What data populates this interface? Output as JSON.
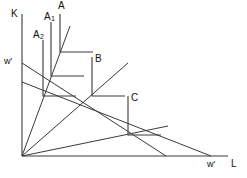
{
  "figure": {
    "type": "economics-isoquant-isocost-diagram",
    "background_color": "#ffffff",
    "line_color": "#3a3a3a",
    "text_color": "#111111"
  },
  "axes": {
    "y_axis_label": "K",
    "x_axis_label": "L",
    "y_axis_price_label": "w′",
    "x_axis_price_label": "w′",
    "origin_px": [
      22,
      156
    ],
    "y_axis_top_px": [
      22,
      14
    ],
    "x_axis_right_px": [
      228,
      156
    ]
  },
  "isoquants": [
    {
      "id": "A",
      "label": "A",
      "label_sub": "",
      "corner_px": [
        60,
        52
      ],
      "vertical_arm_top_px": [
        60,
        14
      ],
      "horizontal_arm_right_px": [
        93,
        52
      ]
    },
    {
      "id": "A1",
      "label": "A",
      "label_sub": "1",
      "corner_px": [
        51,
        76
      ],
      "vertical_arm_top_px": [
        51,
        22
      ],
      "horizontal_arm_right_px": [
        84,
        76
      ]
    },
    {
      "id": "A2",
      "label": "A",
      "label_sub": "2",
      "corner_px": [
        43,
        96
      ],
      "vertical_arm_top_px": [
        43,
        40
      ],
      "horizontal_arm_right_px": [
        76,
        96
      ]
    },
    {
      "id": "B",
      "label": "B",
      "label_sub": "",
      "corner_px": [
        92,
        96
      ],
      "vertical_arm_top_px": [
        92,
        57
      ],
      "horizontal_arm_right_px": [
        125,
        96
      ]
    },
    {
      "id": "C",
      "label": "C",
      "label_sub": "",
      "corner_px": [
        128,
        135
      ],
      "vertical_arm_top_px": [
        128,
        96
      ],
      "horizontal_arm_right_px": [
        161,
        135
      ]
    }
  ],
  "isocost_lines": [
    {
      "id": "isocost-upper",
      "from_px": [
        22,
        63
      ],
      "to_px": [
        166,
        156
      ]
    },
    {
      "id": "isocost-lower",
      "from_px": [
        22,
        82
      ],
      "to_px": [
        211,
        156
      ]
    }
  ],
  "expansion_rays": [
    {
      "id": "ray-steep-A",
      "from_px": [
        22,
        156
      ],
      "to_px": [
        70,
        26
      ]
    },
    {
      "id": "ray-mid-B",
      "from_px": [
        22,
        156
      ],
      "to_px": [
        128,
        63
      ]
    },
    {
      "id": "ray-shallow-C",
      "from_px": [
        22,
        156
      ],
      "to_px": [
        168,
        126
      ]
    }
  ],
  "labels": {
    "k_axis": {
      "text": "K",
      "px": [
        11,
        9
      ]
    },
    "l_axis": {
      "text": "L",
      "px": [
        231,
        160
      ]
    },
    "w_prime_vertical": {
      "text": "w′",
      "px": [
        5,
        58
      ]
    },
    "w_prime_horizontal": {
      "text": "w′",
      "px": [
        208,
        160
      ]
    },
    "A": {
      "text": "A",
      "px": [
        58,
        1
      ]
    },
    "A1": {
      "text": "A",
      "sub": "1",
      "px": [
        44,
        12
      ]
    },
    "A2": {
      "text": "A",
      "sub": "2",
      "px": [
        33,
        30
      ]
    },
    "B": {
      "text": "B",
      "px": [
        95,
        55
      ]
    },
    "C": {
      "text": "C",
      "px": [
        131,
        94
      ]
    }
  }
}
